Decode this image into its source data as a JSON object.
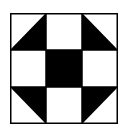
{
  "figure": {
    "grid": {
      "rows": 3,
      "cols": 3
    },
    "colors": {
      "dark": "#000000",
      "light": "#ffffff",
      "border": "#000000"
    },
    "cells": [
      {
        "row": 0,
        "col": 0,
        "type": "half-square-triangle",
        "dark_half": "bottom-right"
      },
      {
        "row": 0,
        "col": 1,
        "type": "solid",
        "fill": "light"
      },
      {
        "row": 0,
        "col": 2,
        "type": "half-square-triangle",
        "dark_half": "bottom-left"
      },
      {
        "row": 1,
        "col": 0,
        "type": "solid",
        "fill": "light"
      },
      {
        "row": 1,
        "col": 1,
        "type": "solid",
        "fill": "dark"
      },
      {
        "row": 1,
        "col": 2,
        "type": "solid",
        "fill": "light"
      },
      {
        "row": 2,
        "col": 0,
        "type": "half-square-triangle",
        "dark_half": "top-right"
      },
      {
        "row": 2,
        "col": 1,
        "type": "solid",
        "fill": "light"
      },
      {
        "row": 2,
        "col": 2,
        "type": "half-square-triangle",
        "dark_half": "top-left"
      }
    ]
  }
}
